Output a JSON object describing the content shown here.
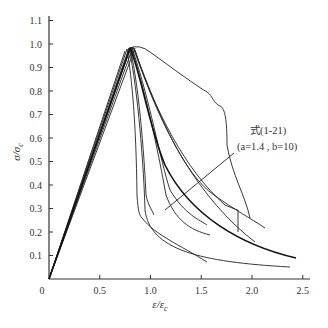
{
  "chart_data": {
    "type": "line",
    "title": "",
    "xlabel": "ε/ε_c",
    "ylabel": "σ/σ_c",
    "xlim": [
      0,
      2.6
    ],
    "ylim": [
      0,
      1.1
    ],
    "x_ticks": [
      "0",
      "0.5",
      "1.0",
      "1.5",
      "2.0",
      "2.5"
    ],
    "y_ticks": [
      "0.1",
      "0.2",
      "0.3",
      "0.4",
      "0.5",
      "0.6",
      "0.7",
      "0.8",
      "0.9",
      "1.0",
      "1.1"
    ],
    "grid": false,
    "legend": null,
    "annotation": {
      "line1": "式(1-21)",
      "line2": "(a=1.4 , b=10)"
    },
    "series": [
      {
        "name": "test-1",
        "x": [
          0,
          0.8,
          0.85,
          1.4,
          1.7,
          1.75,
          2.0
        ],
        "y": [
          0,
          0.98,
          0.97,
          0.82,
          0.73,
          0.57,
          0.38
        ]
      },
      {
        "name": "test-2",
        "x": [
          0,
          0.8,
          0.9,
          0.92,
          0.95,
          1.2,
          1.5
        ],
        "y": [
          0,
          0.97,
          0.7,
          0.28,
          0.22,
          0.14,
          0.08
        ]
      },
      {
        "name": "test-3",
        "x": [
          0,
          0.82,
          0.95,
          1.0,
          1.05,
          1.3,
          1.7,
          2.0,
          2.4
        ],
        "y": [
          0,
          0.98,
          0.6,
          0.3,
          0.16,
          0.11,
          0.08,
          0.07,
          0.06
        ]
      },
      {
        "name": "test-4",
        "x": [
          0,
          0.82,
          0.95,
          1.0,
          1.05
        ],
        "y": [
          0,
          0.97,
          0.6,
          0.35,
          0.27
        ]
      },
      {
        "name": "test-5",
        "x": [
          0,
          0.83,
          1.0,
          1.1,
          1.35,
          1.6
        ],
        "y": [
          0,
          0.98,
          0.65,
          0.33,
          0.22,
          0.19
        ]
      },
      {
        "name": "test-6",
        "x": [
          0,
          0.84,
          1.05,
          1.3,
          1.6
        ],
        "y": [
          0,
          0.97,
          0.55,
          0.32,
          0.24
        ]
      },
      {
        "name": "test-7",
        "x": [
          0,
          0.84,
          1.1,
          1.5,
          1.8,
          1.88
        ],
        "y": [
          0,
          0.98,
          0.6,
          0.37,
          0.3,
          0.2
        ]
      },
      {
        "name": "test-8",
        "x": [
          0,
          0.85,
          1.1,
          1.6,
          2.1
        ],
        "y": [
          0,
          0.97,
          0.62,
          0.33,
          0.25
        ]
      },
      {
        "name": "test-9",
        "x": [
          0,
          0.85,
          1.15,
          1.35,
          1.55,
          2.0
        ],
        "y": [
          0,
          0.96,
          0.5,
          0.35,
          0.28,
          0.22
        ]
      },
      {
        "name": "formula-1-21 (a=1.4, b=10)",
        "x": [
          0,
          0.82,
          1.0,
          1.2,
          1.5,
          2.0,
          2.45
        ],
        "y": [
          0,
          0.98,
          0.68,
          0.45,
          0.3,
          0.17,
          0.09
        ]
      }
    ]
  },
  "axes": {
    "x_label_main": "ε/ε",
    "x_label_sub": "c",
    "y_label_main": "σ/σ",
    "y_label_sub": "c"
  }
}
